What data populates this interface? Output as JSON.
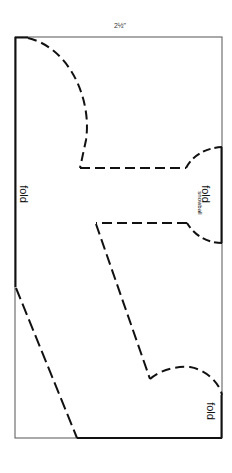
{
  "pattern": {
    "dimension_label": "2½\"",
    "labels": {
      "fold_left": "fold",
      "fold_right_middle": "fold",
      "snowball": "snowball",
      "fold_right_bottom": "fold"
    },
    "colors": {
      "line": "#111111",
      "frame": "#555555",
      "background": "#ffffff"
    }
  }
}
